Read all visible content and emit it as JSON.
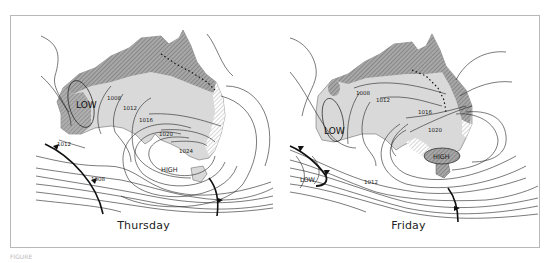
{
  "figure": {
    "panels": [
      {
        "day": "Thursday",
        "pressure_systems": [
          {
            "type": "LOW",
            "label": "LOW"
          },
          {
            "type": "HIGH",
            "label": "HIGH"
          }
        ],
        "isobars": [
          "1008",
          "1012",
          "1016",
          "1020",
          "1024",
          "1012",
          "1008"
        ]
      },
      {
        "day": "Friday",
        "pressure_systems": [
          {
            "type": "LOW",
            "label": "LOW"
          },
          {
            "type": "LOW",
            "label": "LOW"
          },
          {
            "type": "HIGH",
            "label": "HIGH"
          }
        ],
        "isobars": [
          "1008",
          "1012",
          "1016",
          "1020",
          "1012"
        ]
      }
    ],
    "caption": "FIGURE"
  },
  "colors": {
    "land_light": "#d9d9d9",
    "land_dark": "#a8a8a8",
    "isobar": "#222222",
    "front": "#111111",
    "frame": "#b8b8b8"
  }
}
